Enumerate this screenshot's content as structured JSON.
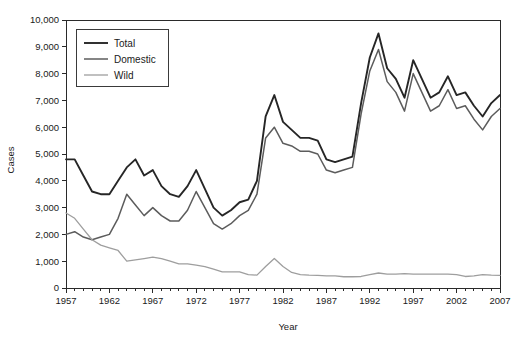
{
  "chart_data": {
    "type": "line",
    "title": "",
    "xlabel": "Year",
    "ylabel": "Cases",
    "xlim": [
      1957,
      2007
    ],
    "ylim": [
      0,
      10000
    ],
    "grid": false,
    "legend_position": "top-left",
    "x_tick_labels": [
      "1957",
      "1962",
      "1967",
      "1972",
      "1977",
      "1982",
      "1987",
      "1992",
      "1997",
      "2002",
      "2007"
    ],
    "x_tick_values": [
      1957,
      1962,
      1967,
      1972,
      1977,
      1982,
      1987,
      1992,
      1997,
      2002,
      2007
    ],
    "x_minor_tick_step": 1,
    "y_tick_labels": [
      "0",
      "1,000",
      "2,000",
      "3,000",
      "4,000",
      "5,000",
      "6,000",
      "7,000",
      "8,000",
      "9,000",
      "10,000"
    ],
    "y_tick_values": [
      0,
      1000,
      2000,
      3000,
      4000,
      5000,
      6000,
      7000,
      8000,
      9000,
      10000
    ],
    "x": [
      1957,
      1958,
      1959,
      1960,
      1961,
      1962,
      1963,
      1964,
      1965,
      1966,
      1967,
      1968,
      1969,
      1970,
      1971,
      1972,
      1973,
      1974,
      1975,
      1976,
      1977,
      1978,
      1979,
      1980,
      1981,
      1982,
      1983,
      1984,
      1985,
      1986,
      1987,
      1988,
      1989,
      1990,
      1991,
      1992,
      1993,
      1994,
      1995,
      1996,
      1997,
      1998,
      1999,
      2000,
      2001,
      2002,
      2003,
      2004,
      2005,
      2006,
      2007
    ],
    "series": [
      {
        "name": "Total",
        "color": "#262626",
        "width": 1.9,
        "values": [
          4800,
          4800,
          4200,
          3600,
          3500,
          3500,
          4000,
          4500,
          4800,
          4200,
          4400,
          3800,
          3500,
          3400,
          3800,
          4400,
          3700,
          3000,
          2700,
          2900,
          3200,
          3300,
          4000,
          6400,
          7200,
          6200,
          5900,
          5600,
          5600,
          5500,
          4800,
          4700,
          4800,
          4900,
          6900,
          8600,
          9500,
          8200,
          7800,
          7100,
          8500,
          7800,
          7100,
          7300,
          7900,
          7200,
          7300,
          6800,
          6400,
          6900,
          7200
        ]
      },
      {
        "name": "Domestic",
        "color": "#5c5c5c",
        "width": 1.5,
        "values": [
          2000,
          2100,
          1900,
          1800,
          1900,
          2000,
          2600,
          3500,
          3100,
          2700,
          3000,
          2700,
          2500,
          2500,
          2900,
          3600,
          3000,
          2400,
          2200,
          2400,
          2700,
          2900,
          3500,
          5600,
          6000,
          5400,
          5300,
          5100,
          5100,
          5000,
          4400,
          4300,
          4400,
          4500,
          6500,
          8100,
          8900,
          7700,
          7300,
          6600,
          8000,
          7300,
          6600,
          6800,
          7400,
          6700,
          6800,
          6300,
          5900,
          6400,
          6700
        ]
      },
      {
        "name": "Wild",
        "color": "#9e9e9e",
        "width": 1.3,
        "values": [
          2800,
          2600,
          2200,
          1800,
          1600,
          1500,
          1400,
          1000,
          1050,
          1100,
          1150,
          1100,
          1000,
          900,
          900,
          850,
          800,
          700,
          600,
          600,
          600,
          500,
          480,
          800,
          1100,
          800,
          580,
          500,
          480,
          470,
          450,
          450,
          420,
          420,
          430,
          500,
          560,
          520,
          520,
          540,
          520,
          520,
          520,
          520,
          520,
          500,
          430,
          450,
          500,
          480,
          470
        ]
      }
    ]
  },
  "legend": {
    "items": [
      {
        "label": "Total"
      },
      {
        "label": "Domestic"
      },
      {
        "label": "Wild"
      }
    ]
  },
  "axes": {
    "x_title": "Year",
    "y_title": "Cases"
  }
}
